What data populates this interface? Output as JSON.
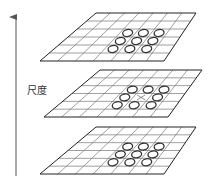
{
  "diagram": {
    "axis_label": "尺度",
    "axis_direction": "up",
    "colors": {
      "grid": "#777777",
      "outline": "#222222",
      "circle": "#333333",
      "arrow": "#555555",
      "center_mark": "#666666"
    },
    "grid": {
      "cols": 7,
      "rows": 6
    },
    "layers": [
      {
        "name": "upper-scale",
        "corners": {
          "tl": [
            96,
            13
          ],
          "tr": [
            196,
            13
          ],
          "br": [
            164,
            61
          ],
          "bl": [
            40,
            61
          ]
        },
        "neighbors": 9,
        "center_marked": false
      },
      {
        "name": "current-scale",
        "corners": {
          "tl": [
            100,
            70
          ],
          "tr": [
            202,
            70
          ],
          "br": [
            168,
            117
          ],
          "bl": [
            44,
            117
          ]
        },
        "neighbors": 8,
        "center_marked": true
      },
      {
        "name": "lower-scale",
        "corners": {
          "tl": [
            96,
            127
          ],
          "tr": [
            196,
            127
          ],
          "br": [
            164,
            174
          ],
          "bl": [
            40,
            174
          ]
        },
        "neighbors": 9,
        "center_marked": false
      }
    ],
    "caption": ""
  }
}
